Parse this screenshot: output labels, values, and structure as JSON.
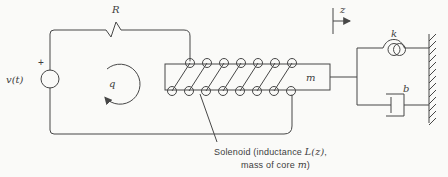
{
  "figure": {
    "type": "electromechanical-solenoid-system-diagram",
    "colors": {
      "background": "#fafaf8",
      "line": "#474747",
      "text": "#3d3d3d"
    },
    "circuit": {
      "source_label": "v(t)",
      "source_polarity": "+",
      "resistor_label": "R",
      "loop_charge_label": "q"
    },
    "mechanical": {
      "mass_label": "m",
      "spring_label": "k",
      "damper_label": "b",
      "displacement_label": "z"
    },
    "caption": {
      "line1_pre": "Solenoid (inductance ",
      "line1_var": "L(z)",
      "line1_post": ",",
      "line2_pre": "mass of core ",
      "line2_var": "m",
      "line2_post": ")"
    }
  }
}
